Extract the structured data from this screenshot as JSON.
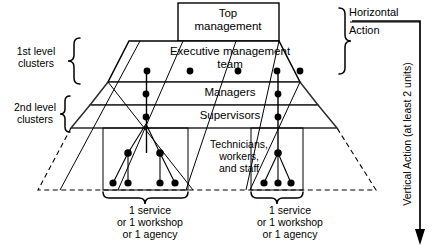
{
  "diagram": {
    "title_box": {
      "line1": "Top",
      "line2": "management",
      "text": "Top\nmanagement"
    },
    "bands": [
      {
        "id": "executive",
        "label": "Executive management\nteam"
      },
      {
        "id": "managers",
        "label": "Managers"
      },
      {
        "id": "supervisors",
        "label": "Supervisors"
      },
      {
        "id": "technicians",
        "label": "Technicians,\nworkers,\nand staff"
      }
    ],
    "left_brackets": [
      {
        "id": "first-level",
        "label": "1st level\nclusters"
      },
      {
        "id": "second-level",
        "label": "2nd level\nclusters"
      }
    ],
    "right_annotations": {
      "horizontal": "Horizontal",
      "action": "Action",
      "vertical": "Vertical Action (at least 2 units)"
    },
    "bottom_units": [
      {
        "id": "unit-left",
        "label": "1 service\nor 1 workshop\nor 1 agency"
      },
      {
        "id": "unit-right",
        "label": "1 service\nor 1 workshop\nor 1 agency"
      }
    ],
    "colors": {
      "stroke": "#000000",
      "band_rule": "#2b2b2b",
      "node_fill": "#000000",
      "background": "#ffffff"
    },
    "nodes": {
      "executive_row": [
        {
          "x": 147,
          "y": 71
        },
        {
          "x": 190,
          "y": 71
        },
        {
          "x": 238,
          "y": 71
        },
        {
          "x": 277,
          "y": 71
        },
        {
          "x": 300,
          "y": 71
        }
      ],
      "managers_row": [
        {
          "x": 146,
          "y": 94
        },
        {
          "x": 278,
          "y": 94
        }
      ],
      "supervisors_row": [
        {
          "x": 146,
          "y": 117
        },
        {
          "x": 278,
          "y": 117
        }
      ],
      "staff_parents": [
        {
          "x": 128,
          "y": 153
        },
        {
          "x": 160,
          "y": 153
        },
        {
          "x": 278,
          "y": 153
        }
      ],
      "staff_children": [
        {
          "x": 113,
          "y": 183
        },
        {
          "x": 128,
          "y": 183
        },
        {
          "x": 160,
          "y": 183
        },
        {
          "x": 175,
          "y": 183
        },
        {
          "x": 264,
          "y": 183
        },
        {
          "x": 278,
          "y": 183
        },
        {
          "x": 291,
          "y": 183
        }
      ]
    }
  }
}
